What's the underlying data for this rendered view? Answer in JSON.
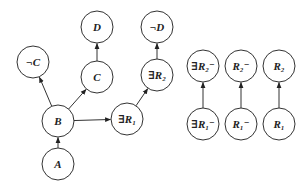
{
  "diagram": {
    "nodes": [
      {
        "id": "negC",
        "label": "¬C",
        "x": 33,
        "y": 62
      },
      {
        "id": "D",
        "label": "D",
        "x": 97,
        "y": 27
      },
      {
        "id": "C",
        "label": "C",
        "x": 97,
        "y": 77
      },
      {
        "id": "negD",
        "label": "¬D",
        "x": 157,
        "y": 27
      },
      {
        "id": "existsR2",
        "label": "∃R₂",
        "x": 157,
        "y": 75
      },
      {
        "id": "B",
        "label": "B",
        "x": 58,
        "y": 121
      },
      {
        "id": "existsR1",
        "label": "∃R₁",
        "x": 127,
        "y": 119
      },
      {
        "id": "A",
        "label": "A",
        "x": 58,
        "y": 164
      },
      {
        "id": "existsR2inv",
        "label": "∃R₂⁻",
        "x": 203,
        "y": 66
      },
      {
        "id": "R2inv",
        "label": "R₂⁻",
        "x": 241,
        "y": 66
      },
      {
        "id": "R2",
        "label": "R₂",
        "x": 279,
        "y": 66
      },
      {
        "id": "existsR1inv",
        "label": "∃R₁⁻",
        "x": 203,
        "y": 124
      },
      {
        "id": "R1inv",
        "label": "R₁⁻",
        "x": 241,
        "y": 124
      },
      {
        "id": "R1",
        "label": "R₁",
        "x": 279,
        "y": 124
      }
    ],
    "edges": [
      {
        "from": "A",
        "to": "B"
      },
      {
        "from": "B",
        "to": "negC"
      },
      {
        "from": "B",
        "to": "C"
      },
      {
        "from": "C",
        "to": "D"
      },
      {
        "from": "B",
        "to": "existsR1"
      },
      {
        "from": "existsR1",
        "to": "existsR2"
      },
      {
        "from": "existsR2",
        "to": "negD"
      },
      {
        "from": "existsR1inv",
        "to": "existsR2inv"
      },
      {
        "from": "R1inv",
        "to": "R2inv"
      },
      {
        "from": "R1",
        "to": "R2"
      }
    ],
    "node_radius": 16,
    "stroke_color": "#333333"
  }
}
